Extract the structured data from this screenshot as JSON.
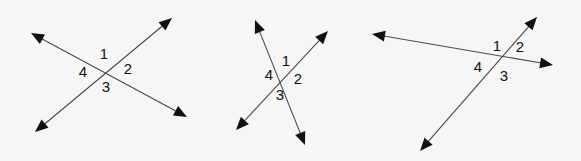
{
  "page": {
    "background_color": "#f6f6f6",
    "line_color": "#4a4a4a",
    "label_color": "#111111",
    "arrow_color": "#111111",
    "width": 581,
    "height": 161
  },
  "figures": [
    {
      "id": "figure-1",
      "description": "two straight lines crossing in an X, each with arrowheads on both ends",
      "intersection": {
        "x": 105,
        "y": 70
      },
      "lines": [
        {
          "id": "figure-1-line-a",
          "name": "rising-line",
          "from": {
            "x": 35,
            "y": 132
          },
          "to": {
            "x": 172,
            "y": 18
          }
        },
        {
          "id": "figure-1-line-b",
          "name": "falling-line",
          "from": {
            "x": 31,
            "y": 33
          },
          "to": {
            "x": 187,
            "y": 117
          }
        }
      ],
      "labels": [
        {
          "text": "1",
          "x": 104,
          "y": 55
        },
        {
          "text": "2",
          "x": 128,
          "y": 70
        },
        {
          "text": "3",
          "x": 106,
          "y": 88
        },
        {
          "text": "4",
          "x": 83,
          "y": 73
        }
      ]
    },
    {
      "id": "figure-2",
      "description": "two straight lines crossing at a narrow angle, each with arrowheads on both ends",
      "intersection": {
        "x": 285,
        "y": 78
      },
      "lines": [
        {
          "id": "figure-2-line-a",
          "name": "steep-line",
          "from": {
            "x": 255,
            "y": 20
          },
          "to": {
            "x": 305,
            "y": 145
          }
        },
        {
          "id": "figure-2-line-b",
          "name": "rising-line",
          "from": {
            "x": 236,
            "y": 130
          },
          "to": {
            "x": 328,
            "y": 31
          }
        }
      ],
      "labels": [
        {
          "text": "1",
          "x": 286,
          "y": 62
        },
        {
          "text": "2",
          "x": 298,
          "y": 80
        },
        {
          "text": "3",
          "x": 280,
          "y": 96
        },
        {
          "text": "4",
          "x": 269,
          "y": 76
        }
      ]
    },
    {
      "id": "figure-3",
      "description": "a near-horizontal line crossed by a steep diagonal line, each with arrowheads on both ends",
      "intersection": {
        "x": 504,
        "y": 62
      },
      "lines": [
        {
          "id": "figure-3-line-a",
          "name": "near-horizontal-line",
          "from": {
            "x": 372,
            "y": 34
          },
          "to": {
            "x": 553,
            "y": 65
          }
        },
        {
          "id": "figure-3-line-b",
          "name": "steep-diagonal-line",
          "from": {
            "x": 420,
            "y": 151
          },
          "to": {
            "x": 537,
            "y": 17
          }
        }
      ],
      "labels": [
        {
          "text": "1",
          "x": 497,
          "y": 47
        },
        {
          "text": "2",
          "x": 520,
          "y": 48
        },
        {
          "text": "3",
          "x": 504,
          "y": 77
        },
        {
          "text": "4",
          "x": 478,
          "y": 68
        }
      ]
    }
  ]
}
